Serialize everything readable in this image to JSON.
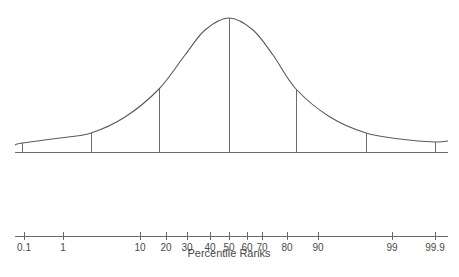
{
  "chart_data": {
    "type": "line",
    "title": "",
    "curve": {
      "kind": "normal-distribution",
      "sd_markers": [
        -3,
        -2,
        -1,
        0,
        1,
        2,
        3
      ],
      "marker_heights_relative": [
        0.07,
        0.14,
        0.47,
        1.0,
        0.47,
        0.14,
        0.07
      ],
      "points_px": [
        [
          15,
          145
        ],
        [
          22,
          143
        ],
        [
          60,
          138
        ],
        [
          91,
          133
        ],
        [
          125,
          117
        ],
        [
          159,
          89
        ],
        [
          185,
          55
        ],
        [
          205,
          30
        ],
        [
          229,
          18
        ],
        [
          253,
          30
        ],
        [
          273,
          55
        ],
        [
          296,
          89
        ],
        [
          330,
          117
        ],
        [
          366,
          133
        ],
        [
          400,
          139
        ],
        [
          435,
          142
        ],
        [
          448,
          141
        ]
      ],
      "baseline_px": {
        "y": 152,
        "x_start": 15,
        "x_end": 448
      },
      "markers_px": [
        {
          "sd": -3,
          "x": 22,
          "top": 143
        },
        {
          "sd": -2,
          "x": 91,
          "top": 133
        },
        {
          "sd": -1,
          "x": 159,
          "top": 89
        },
        {
          "sd": 0,
          "x": 229,
          "top": 18
        },
        {
          "sd": 1,
          "x": 296,
          "top": 89
        },
        {
          "sd": 2,
          "x": 366,
          "top": 133
        },
        {
          "sd": 3,
          "x": 435,
          "top": 142
        }
      ]
    },
    "percentile_axis": {
      "xlabel": "Percentile Ranks",
      "ticks": [
        "0.1",
        "1",
        "10",
        "20",
        "30",
        "40",
        "50",
        "60",
        "70",
        "80",
        "90",
        "99",
        "99.9"
      ],
      "tick_values": [
        0.1,
        1,
        10,
        20,
        30,
        40,
        50,
        60,
        70,
        80,
        90,
        99,
        99.9
      ],
      "tick_x_px": [
        24,
        63,
        140,
        166,
        187,
        210,
        229,
        247,
        262,
        287,
        318,
        392,
        435
      ],
      "axis_px": {
        "y": 236,
        "x_start": 15,
        "x_end": 448
      }
    },
    "grid": false,
    "legend": null
  },
  "labels": {
    "axis_title": "Percentile Ranks",
    "ticks": [
      "0.1",
      "1",
      "10",
      "20",
      "30",
      "40",
      "50",
      "60",
      "70",
      "80",
      "90",
      "99",
      "99.9"
    ]
  },
  "colors": {
    "line": "#6b6b6b",
    "curve": "#5a5a5a",
    "text": "#4a4a4a",
    "background": "#ffffff"
  }
}
